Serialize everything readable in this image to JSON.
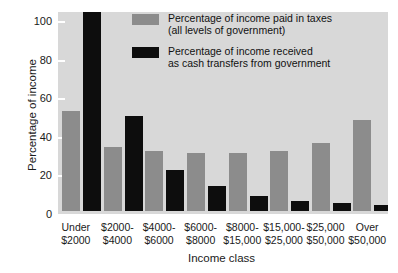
{
  "chart_data": {
    "type": "bar",
    "title": "",
    "xlabel": "Income class",
    "ylabel": "Percentage of income",
    "ylim": [
      0,
      100
    ],
    "yticks": [
      0,
      20,
      40,
      60,
      80,
      100
    ],
    "grid": false,
    "legend_position": "upper-right-inside",
    "categories": [
      "Under $2000",
      "$2000-$4000",
      "$4000-$6000",
      "$6000-$8000",
      "$8000-$15,000",
      "$15,000-$25,000",
      "$25,000-$50,000",
      "Over $50,000"
    ],
    "category_lines": [
      [
        "Under",
        "$2000"
      ],
      [
        "$2000-",
        "$4000"
      ],
      [
        "$4000-",
        "$6000"
      ],
      [
        "$6000-",
        "$8000"
      ],
      [
        "$8000-",
        "$15,000"
      ],
      [
        "$15,000-",
        "$25,000"
      ],
      [
        "$25,000",
        "$50,000"
      ],
      [
        "Over",
        "$50,000"
      ]
    ],
    "series": [
      {
        "name": "Percentage of income paid in taxes (all levels of government)",
        "color": "#8c8c8c",
        "values": [
          52,
          33,
          31,
          30,
          30,
          31,
          35,
          47
        ]
      },
      {
        "name": "Percentage of income received as cash transfers from government",
        "color": "#0d0d0d",
        "values": [
          107,
          49,
          21,
          13,
          8,
          5,
          4,
          3
        ]
      }
    ]
  },
  "legend": {
    "entries": [
      {
        "swatch": "gray",
        "line1": "Percentage of income paid in taxes",
        "line2": "(all levels of government)"
      },
      {
        "swatch": "black",
        "line1": "Percentage of income received",
        "line2": "as cash transfers from government"
      }
    ]
  },
  "colors": {
    "plot_background": "#d8d8d8",
    "page_background": "#ffffff",
    "axis": "#ffffff",
    "series_gray": "#8c8c8c",
    "series_black": "#0d0d0d",
    "text": "#1a1a1a"
  }
}
